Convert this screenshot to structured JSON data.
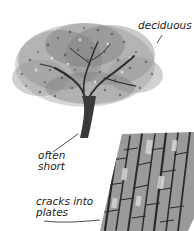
{
  "figure": {
    "labels": {
      "deciduous": "deciduous",
      "often_short_line1": "often",
      "often_short_line2": "short",
      "cracks_line1": "cracks into",
      "cracks_line2": "plates"
    },
    "colors": {
      "ink": "#222222",
      "foliage_dark": "#3a3a3a",
      "foliage_mid": "#777777",
      "foliage_light": "#b5b5b5",
      "bark_dark": "#2b2b2b",
      "bark_mid": "#7a7a7a",
      "bark_light": "#c8c8c8"
    }
  }
}
